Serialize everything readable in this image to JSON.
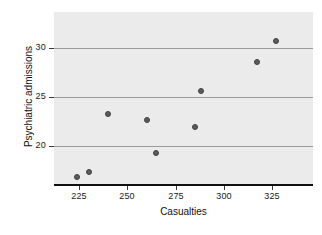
{
  "chart_data": {
    "type": "scatter",
    "title": "",
    "xlabel": "Casualties",
    "ylabel": "Psychiatric admissions",
    "xlim": [
      212,
      346
    ],
    "ylim": [
      16.2,
      33.6
    ],
    "xticks": [
      225,
      250,
      275,
      300,
      325
    ],
    "yticks": [
      20,
      25,
      30
    ],
    "grid": "horizontal",
    "legend": "none",
    "series": [
      {
        "name": "observations",
        "x": [
          224,
          230,
          240,
          260,
          265,
          285,
          288,
          317,
          327
        ],
        "y": [
          16.9,
          17.4,
          23.3,
          22.7,
          19.3,
          22.0,
          25.6,
          28.5,
          30.7
        ]
      }
    ]
  },
  "style": {
    "panel_bg": "#ebebeb",
    "grid_color": "#9a9a9a",
    "point_fill": "#5b5b5b",
    "point_stroke": "#3f3f3f",
    "axis_color": "#111111",
    "text_color": "#1a1a1a"
  },
  "axis": {
    "x_tick_labels": [
      "225",
      "250",
      "275",
      "300",
      "325"
    ],
    "y_tick_labels": [
      "20",
      "25",
      "30"
    ]
  }
}
